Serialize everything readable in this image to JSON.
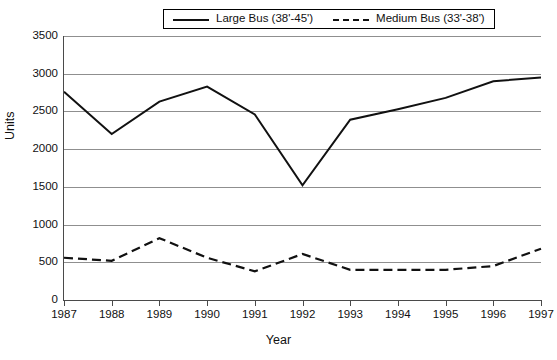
{
  "chart_data": {
    "type": "line",
    "title": "",
    "xlabel": "Year",
    "ylabel": "Units",
    "categories": [
      "1987",
      "1988",
      "1989",
      "1990",
      "1991",
      "1992",
      "1993",
      "1994",
      "1995",
      "1996",
      "1997"
    ],
    "x": [
      1987,
      1988,
      1989,
      1990,
      1991,
      1992,
      1993,
      1994,
      1995,
      1996,
      1997
    ],
    "series": [
      {
        "name": "Large Bus (38'-45')",
        "style": "solid",
        "color": "#111111",
        "values": [
          2760,
          2200,
          2630,
          2830,
          2460,
          1520,
          2390,
          2530,
          2680,
          2900,
          2950
        ]
      },
      {
        "name": "Medium Bus (33'-38')",
        "style": "dashed",
        "color": "#111111",
        "values": [
          560,
          520,
          820,
          560,
          380,
          610,
          400,
          400,
          400,
          450,
          680
        ]
      }
    ],
    "ylim": [
      0,
      3500
    ],
    "yticks": [
      0,
      500,
      1000,
      1500,
      2000,
      2500,
      3000,
      3500
    ],
    "ytick_labels": [
      "0",
      "500",
      "1000",
      "1500",
      "2000",
      "2500",
      "3000",
      "3500"
    ],
    "xlim": [
      1987,
      1997
    ],
    "grid": "horizontal",
    "grid_color": "#8f8f8f",
    "legend_position": "top-center",
    "background": "#ffffff"
  },
  "legend": {
    "entries": [
      {
        "label": "Large Bus (38'-45')",
        "style": "solid"
      },
      {
        "label": "Medium Bus (33'-38')",
        "style": "dashed"
      }
    ]
  },
  "axes": {
    "x_title": "Year",
    "y_title": "Units"
  }
}
